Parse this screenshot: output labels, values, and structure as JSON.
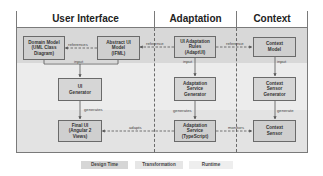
{
  "diagram": {
    "columns": [
      {
        "id": "user-interface",
        "title": "User Interface"
      },
      {
        "id": "adaptation",
        "title": "Adaptation"
      },
      {
        "id": "context",
        "title": "Context"
      }
    ],
    "boxes": {
      "domain_model": {
        "line1": "Domain Model",
        "line2": "(UML Class",
        "line3": "Diagram)"
      },
      "abstract_ui_model": {
        "line1": "Abstract UI",
        "line2": "Model",
        "line3": "(IFML)"
      },
      "ui_adaptation_rules": {
        "line1": "UI Adaptation",
        "line2": "Rules",
        "line3": "(AdaptUI)"
      },
      "context_model": {
        "line1": "Context",
        "line2": "Model"
      },
      "ui_generator": {
        "line1": "UI",
        "line2": "Generator"
      },
      "adaptation_service_generator": {
        "line1": "Adaptation",
        "line2": "Service",
        "line3": "Generator"
      },
      "context_sensor_generator": {
        "line1": "Context",
        "line2": "Sensor",
        "line3": "Generator"
      },
      "final_ui": {
        "line1": "Final UI",
        "line2": "(Angular 2",
        "line3": "Views)"
      },
      "adaptation_service": {
        "line1": "Adaptation",
        "line2": "Service",
        "line3": "(TypeScript)"
      },
      "context_sensor": {
        "line1": "Context",
        "line2": "Sensor"
      }
    },
    "edges": {
      "references": "references",
      "reference_left": "reference",
      "reference_right": "reference",
      "input_ui": "input",
      "input_adapt": "input",
      "input_context": "input",
      "generates_ui": "generates",
      "generates_adapt": "generates",
      "generates_context": "generate",
      "adapts": "adapts",
      "monitors": "monitors"
    },
    "legend": [
      {
        "label": "Design Time",
        "color": "#d6d6d6"
      },
      {
        "label": "Transformation",
        "color": "#e6e6e6"
      },
      {
        "label": "Runtime",
        "color": "#eeeeee"
      }
    ]
  }
}
